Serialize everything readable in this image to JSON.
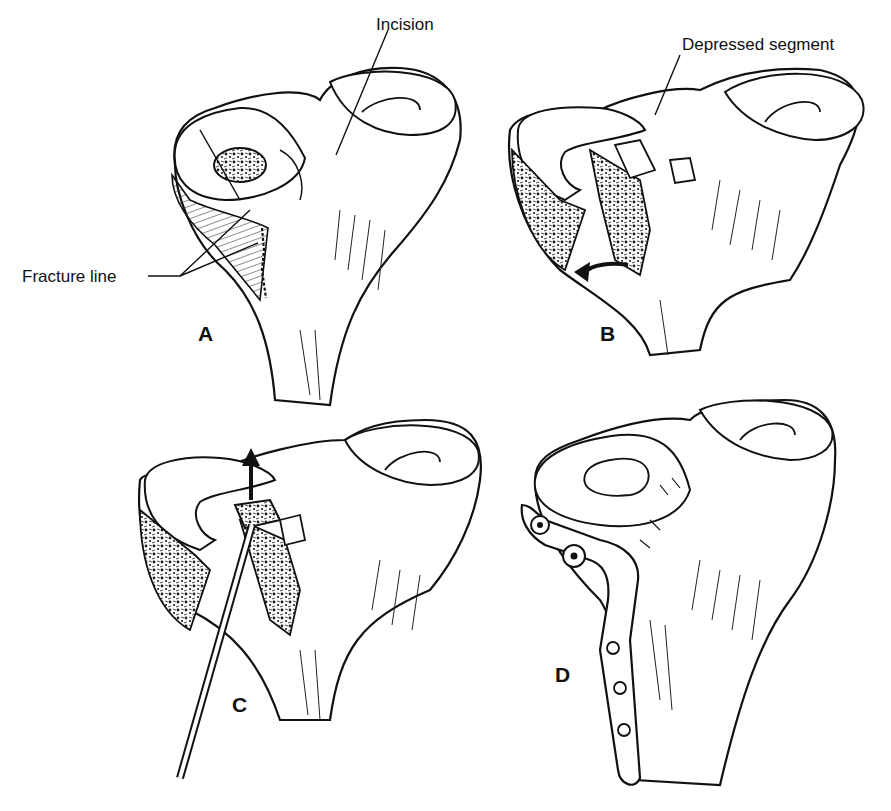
{
  "figure": {
    "background": "#ffffff",
    "ink": "#111111"
  },
  "panels": [
    {
      "id": "A",
      "letter": "A",
      "callouts": [
        "Incision",
        "Fracture line"
      ]
    },
    {
      "id": "B",
      "letter": "B",
      "callouts": [
        "Depressed segment"
      ]
    },
    {
      "id": "C",
      "letter": "C",
      "callouts": []
    },
    {
      "id": "D",
      "letter": "D",
      "callouts": []
    }
  ],
  "labels": {
    "incision": "Incision",
    "fracture_line": "Fracture line",
    "depressed_segment": "Depressed segment"
  }
}
